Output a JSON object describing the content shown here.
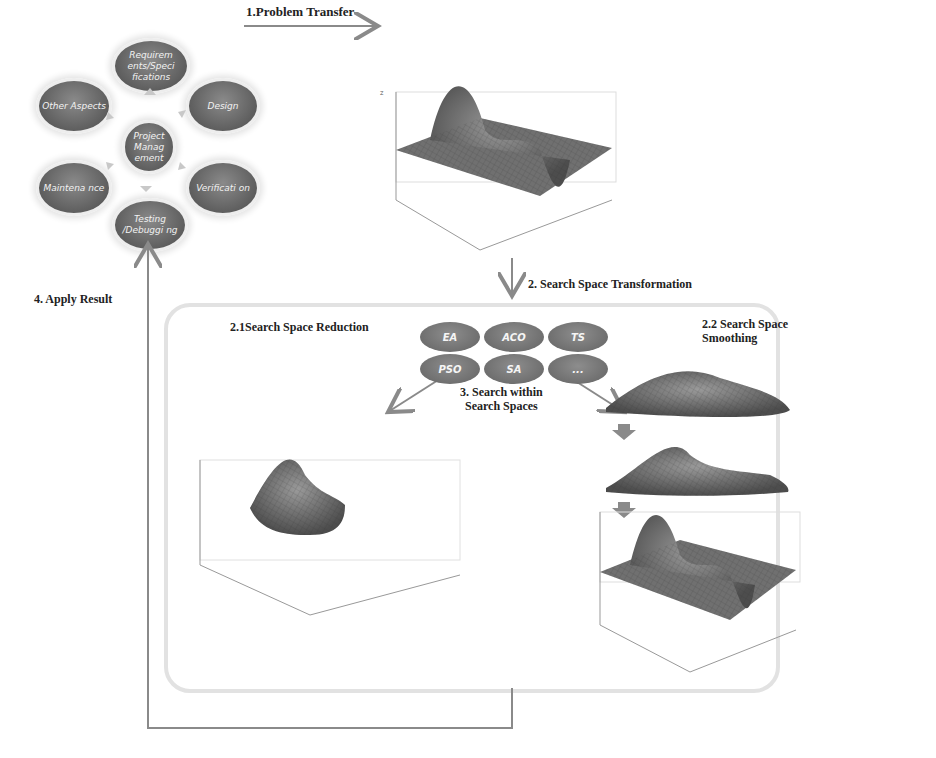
{
  "cycle": {
    "center": "Project Manag ement",
    "nodes": [
      {
        "id": "requirements",
        "label": "Requirem ents/Speci fications"
      },
      {
        "id": "design",
        "label": "Design"
      },
      {
        "id": "verification",
        "label": "Verificati on"
      },
      {
        "id": "testing",
        "label": "Testing /Debuggi ng"
      },
      {
        "id": "maintenance",
        "label": "Maintena nce"
      },
      {
        "id": "other",
        "label": "Other Aspects"
      }
    ]
  },
  "steps": {
    "problem_transfer": "1.Problem Transfer",
    "search_space_transformation": "2. Search Space Transformation",
    "reduction": "2.1Search Space Reduction",
    "smoothing_line1": "2.2 Search Space",
    "smoothing_line2": "Smoothing",
    "search_within_line1": "3. Search within",
    "search_within_line2": "Search Spaces",
    "apply_result": "4. Apply Result"
  },
  "algorithms": [
    "EA",
    "ACO",
    "TS",
    "PSO",
    "SA",
    "..."
  ],
  "plot_axes": {
    "z_ticks": [
      "8",
      "6",
      "4",
      "2",
      "0",
      "-2",
      "-4",
      "-6",
      "-8"
    ],
    "y_ticks": [
      "3",
      "2",
      "1",
      "0",
      "-1",
      "-2",
      "-3"
    ],
    "x_ticks": [
      "-3",
      "-2",
      "-1",
      "0",
      "1",
      "2",
      "3"
    ],
    "xlabel": "X",
    "ylabel": "Y",
    "zlabel": "Z"
  },
  "colors": {
    "node": "#636363",
    "arrow": "#8a8a8a",
    "frame": "#e2e2e2"
  }
}
